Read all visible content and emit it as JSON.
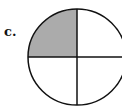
{
  "label": "c.",
  "figure": {
    "type": "fraction-circle",
    "parts": 4,
    "shaded_parts": 1,
    "shaded_quadrant": "top-left",
    "shade_color": "#ababab",
    "stroke_color": "#111111"
  }
}
